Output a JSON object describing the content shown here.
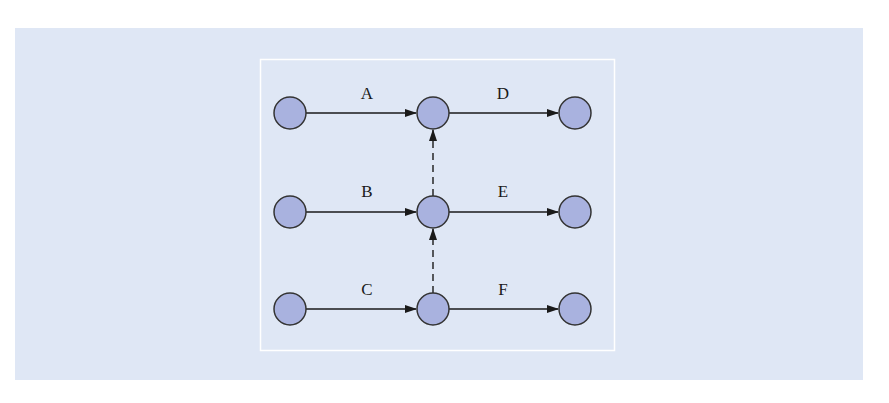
{
  "diagram": {
    "type": "activity-network",
    "colors": {
      "panel_background": "#dfe7f5",
      "frame_border": "#ffffff",
      "node_fill": "#a9b2df",
      "node_stroke": "#333333",
      "edge_stroke": "#1a1a1a"
    },
    "frame": {
      "x": 260,
      "y": 59,
      "width": 354,
      "height": 291
    },
    "nodes": [
      {
        "id": "n1",
        "x": 290,
        "y": 113
      },
      {
        "id": "n2",
        "x": 433,
        "y": 113
      },
      {
        "id": "n3",
        "x": 575,
        "y": 113
      },
      {
        "id": "n4",
        "x": 290,
        "y": 212
      },
      {
        "id": "n5",
        "x": 433,
        "y": 212
      },
      {
        "id": "n6",
        "x": 575,
        "y": 212
      },
      {
        "id": "n7",
        "x": 290,
        "y": 309
      },
      {
        "id": "n8",
        "x": 433,
        "y": 309
      },
      {
        "id": "n9",
        "x": 575,
        "y": 309
      }
    ],
    "edges": [
      {
        "from": "n1",
        "to": "n2",
        "label": "A",
        "style": "solid"
      },
      {
        "from": "n2",
        "to": "n3",
        "label": "D",
        "style": "solid"
      },
      {
        "from": "n4",
        "to": "n5",
        "label": "B",
        "style": "solid"
      },
      {
        "from": "n5",
        "to": "n6",
        "label": "E",
        "style": "solid"
      },
      {
        "from": "n7",
        "to": "n8",
        "label": "C",
        "style": "solid"
      },
      {
        "from": "n8",
        "to": "n9",
        "label": "F",
        "style": "solid"
      },
      {
        "from": "n5",
        "to": "n2",
        "label": "",
        "style": "dashed"
      },
      {
        "from": "n8",
        "to": "n5",
        "label": "",
        "style": "dashed"
      }
    ],
    "labels": {
      "A": "A",
      "B": "B",
      "C": "C",
      "D": "D",
      "E": "E",
      "F": "F"
    }
  }
}
